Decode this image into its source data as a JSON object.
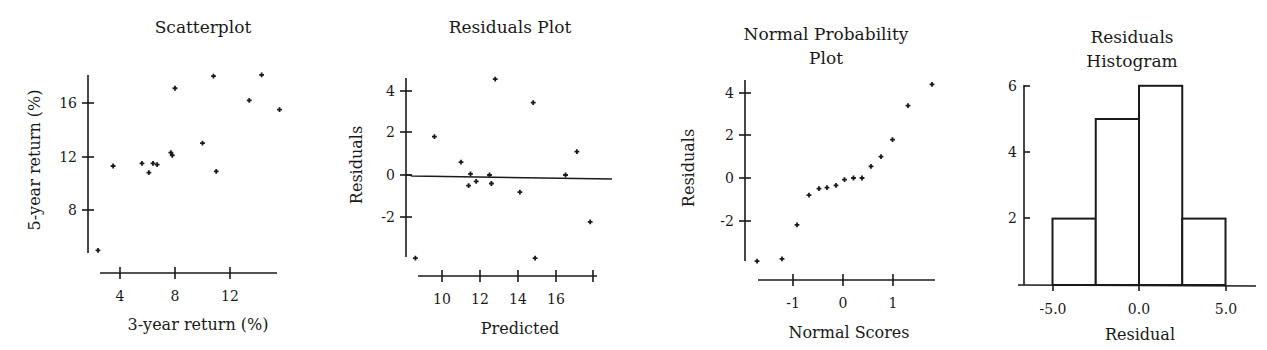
{
  "chart_data": [
    {
      "type": "scatter",
      "title": "Scatterplot",
      "xlabel": "3-year return (%)",
      "ylabel": "5-year return (%)",
      "xticks": [
        4,
        8,
        12
      ],
      "yticks": [
        8,
        16,
        12
      ],
      "xlim": [
        1.2,
        16.1
      ],
      "ylim": [
        4.3,
        18.8
      ],
      "grid": false,
      "points": [
        {
          "x": 2.4,
          "y": 5.0
        },
        {
          "x": 3.5,
          "y": 11.3
        },
        {
          "x": 5.6,
          "y": 11.5
        },
        {
          "x": 6.1,
          "y": 10.8
        },
        {
          "x": 6.4,
          "y": 11.5
        },
        {
          "x": 6.7,
          "y": 11.4
        },
        {
          "x": 7.7,
          "y": 12.3
        },
        {
          "x": 7.8,
          "y": 12.1
        },
        {
          "x": 8.0,
          "y": 17.1
        },
        {
          "x": 10.0,
          "y": 13.0
        },
        {
          "x": 10.8,
          "y": 18.0
        },
        {
          "x": 11.0,
          "y": 10.9
        },
        {
          "x": 13.4,
          "y": 16.2
        },
        {
          "x": 14.3,
          "y": 18.1
        },
        {
          "x": 15.6,
          "y": 15.5
        }
      ]
    },
    {
      "type": "scatter",
      "title": "Residuals Plot",
      "xlabel": "Predicted",
      "ylabel": "Residuals",
      "xticks": [
        10,
        12,
        14,
        16
      ],
      "extra_xticks": [
        18
      ],
      "yticks": [
        4,
        2,
        0,
        -2
      ],
      "xlim": [
        8.6,
        18.0
      ],
      "ylim": [
        -3.9,
        4.6
      ],
      "reference_line": {
        "y_start": -0.05,
        "y_end": -0.15
      },
      "grid": false,
      "points": [
        {
          "x": 8.6,
          "y": -3.9
        },
        {
          "x": 9.6,
          "y": 1.8
        },
        {
          "x": 11.0,
          "y": 0.6
        },
        {
          "x": 11.4,
          "y": -0.5
        },
        {
          "x": 11.5,
          "y": 0.05
        },
        {
          "x": 11.8,
          "y": -0.3
        },
        {
          "x": 12.5,
          "y": 0.0
        },
        {
          "x": 12.6,
          "y": -0.4
        },
        {
          "x": 12.8,
          "y": 4.5
        },
        {
          "x": 14.1,
          "y": -0.8
        },
        {
          "x": 14.8,
          "y": 3.4
        },
        {
          "x": 14.9,
          "y": -3.9
        },
        {
          "x": 16.5,
          "y": 0.0
        },
        {
          "x": 17.1,
          "y": 1.1
        },
        {
          "x": 17.8,
          "y": -2.2
        }
      ]
    },
    {
      "type": "scatter",
      "title": "Normal Probability",
      "title_line2": "Plot",
      "xlabel": "Normal Scores",
      "ylabel": "Residuals",
      "xticks": [
        -1,
        0,
        1
      ],
      "yticks": [
        4,
        2,
        0,
        -2
      ],
      "xlim": [
        -1.7,
        1.8
      ],
      "ylim": [
        -3.9,
        4.5
      ],
      "grid": false,
      "points": [
        {
          "x": -1.72,
          "y": -3.9
        },
        {
          "x": -1.22,
          "y": -3.8
        },
        {
          "x": -0.92,
          "y": -2.2
        },
        {
          "x": -0.68,
          "y": -0.8
        },
        {
          "x": -0.48,
          "y": -0.5
        },
        {
          "x": -0.32,
          "y": -0.45
        },
        {
          "x": -0.14,
          "y": -0.35
        },
        {
          "x": 0.03,
          "y": -0.08
        },
        {
          "x": 0.21,
          "y": 0.0
        },
        {
          "x": 0.38,
          "y": 0.0
        },
        {
          "x": 0.56,
          "y": 0.55
        },
        {
          "x": 0.76,
          "y": 1.0
        },
        {
          "x": 0.99,
          "y": 1.8
        },
        {
          "x": 1.3,
          "y": 3.4
        },
        {
          "x": 1.78,
          "y": 4.4
        }
      ]
    },
    {
      "type": "bar",
      "subtype": "histogram",
      "title": "Residuals",
      "title_line2": "Histogram",
      "xlabel": "Residual",
      "ylabel": "",
      "xticks": [
        "-5.0",
        "0.0",
        "5.0"
      ],
      "yticks": [
        6,
        4,
        2
      ],
      "ylim": [
        0,
        6
      ],
      "grid": false,
      "bins": [
        {
          "from": -5.0,
          "to": -2.5,
          "count": 2
        },
        {
          "from": -2.5,
          "to": 0.0,
          "count": 5
        },
        {
          "from": 0.0,
          "to": 2.5,
          "count": 6
        },
        {
          "from": 2.5,
          "to": 5.0,
          "count": 2
        }
      ]
    }
  ],
  "labels": {
    "scatter": {
      "title": "Scatterplot",
      "xlabel": "3-year return (%)",
      "ylabel": "5-year return (%)",
      "xt": [
        "4",
        "8",
        "12"
      ],
      "yt": [
        "16",
        "12",
        "8"
      ]
    },
    "resid": {
      "title": "Residuals Plot",
      "xlabel": "Predicted",
      "ylabel": "Residuals",
      "xt": [
        "10",
        "12",
        "14",
        "16"
      ],
      "yt": [
        "4",
        "2",
        "0",
        "-2"
      ]
    },
    "normal": {
      "title1": "Normal Probability",
      "title2": "Plot",
      "xlabel": "Normal Scores",
      "ylabel": "Residuals",
      "xt": [
        "-1",
        "0",
        "1"
      ],
      "yt": [
        "4",
        "2",
        "0",
        "-2"
      ]
    },
    "hist": {
      "title1": "Residuals",
      "title2": "Histogram",
      "xlabel": "Residual",
      "xt": [
        "-5.0",
        "0.0",
        "5.0"
      ],
      "yt": [
        "6",
        "4",
        "2"
      ]
    }
  }
}
